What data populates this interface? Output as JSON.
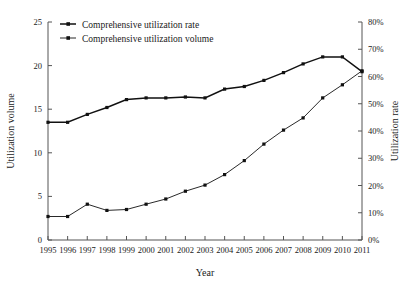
{
  "chart_data": {
    "type": "line",
    "title": "",
    "xlabel": "Year",
    "ylabel": "Utilization volume",
    "y2label": "Utilization rate",
    "categories": [
      "1995",
      "1996",
      "1997",
      "1998",
      "1999",
      "2000",
      "2001",
      "2002",
      "2003",
      "2004",
      "2005",
      "2006",
      "2007",
      "2008",
      "2009",
      "2010",
      "2011"
    ],
    "ylim": [
      0,
      25
    ],
    "yticks": [
      "0",
      "5",
      "10",
      "15",
      "20",
      "25"
    ],
    "y2lim": [
      0,
      80
    ],
    "y2ticks": [
      "0%",
      "10%",
      "20%",
      "30%",
      "40%",
      "50%",
      "60%",
      "70%",
      "80%"
    ],
    "grid": false,
    "legend_position": "top-left",
    "series": [
      {
        "name": "Comprehensive utilization rate",
        "axis": "right",
        "unit": "%",
        "marker": "square",
        "values": [
          13.5,
          13.5,
          14.4,
          15.2,
          16.1,
          16.3,
          16.3,
          16.4,
          16.3,
          17.3,
          17.6,
          18.3,
          19.2,
          20.2,
          21.0,
          21.0,
          19.3
        ]
      },
      {
        "name": "Comprehensive utilization volume",
        "axis": "left",
        "unit": "",
        "marker": "square",
        "values": [
          2.7,
          2.7,
          4.1,
          3.4,
          3.5,
          4.1,
          4.7,
          5.6,
          6.3,
          7.5,
          9.1,
          11.0,
          12.6,
          14.0,
          16.3,
          17.8,
          19.4
        ]
      }
    ]
  }
}
